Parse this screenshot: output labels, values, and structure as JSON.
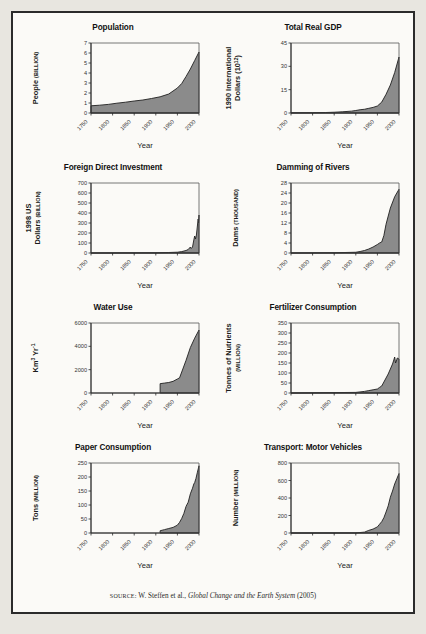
{
  "figure": {
    "source_prefix": "SOURCE:",
    "source_text": "W. Steffen et al.,",
    "source_title": "Global Change and the Earth System",
    "source_year": "(2005)",
    "background_color": "#fbfaf7",
    "border_color": "#2b2b2b",
    "area_fill_color": "#8b8b8b",
    "area_stroke_color": "#1f1f1f"
  },
  "chart_data": [
    {
      "type": "area",
      "title": "Population",
      "xlabel": "Year",
      "ylabel": "People",
      "ylabel_units": "(BILLION)",
      "xlim": [
        1750,
        2000
      ],
      "ylim": [
        0,
        7
      ],
      "xticks": [
        1750,
        1800,
        1850,
        1900,
        1950,
        2000
      ],
      "yticks": [
        0,
        1,
        2,
        3,
        4,
        5,
        6,
        7
      ],
      "grid": false,
      "legend": "none",
      "x": [
        1750,
        1770,
        1790,
        1810,
        1830,
        1850,
        1870,
        1890,
        1910,
        1930,
        1950,
        1960,
        1970,
        1980,
        1990,
        2000
      ],
      "values": [
        0.72,
        0.78,
        0.86,
        0.98,
        1.08,
        1.2,
        1.3,
        1.45,
        1.62,
        1.9,
        2.5,
        2.95,
        3.65,
        4.4,
        5.25,
        6.1
      ]
    },
    {
      "type": "area",
      "title": "Total Real GDP",
      "xlabel": "Year",
      "ylabel": "1990 International Dollars (10¹²)",
      "ylabel_line1": "1990 International",
      "ylabel_line2": "Dollars (10",
      "ylabel_exp": "12",
      "xlim": [
        1750,
        2000
      ],
      "ylim": [
        0,
        45
      ],
      "xticks": [
        1750,
        1800,
        1850,
        1900,
        1950,
        2000
      ],
      "yticks": [
        0,
        15,
        30,
        45
      ],
      "grid": false,
      "legend": "none",
      "x": [
        1750,
        1800,
        1830,
        1850,
        1870,
        1890,
        1900,
        1910,
        1920,
        1930,
        1940,
        1950,
        1960,
        1970,
        1980,
        1990,
        2000
      ],
      "values": [
        0.1,
        0.2,
        0.3,
        0.5,
        0.8,
        1.2,
        1.6,
        2.1,
        2.4,
        3.0,
        3.6,
        4.5,
        7.0,
        12.0,
        18.0,
        26.0,
        36.0
      ]
    },
    {
      "type": "area",
      "title": "Foreign Direct Investment",
      "xlabel": "Year",
      "ylabel": "1998 US Dollars",
      "ylabel_line1": "1998 US",
      "ylabel_line2": "Dollars",
      "ylabel_units": "(BILLION)",
      "xlim": [
        1750,
        2000
      ],
      "ylim": [
        0,
        700
      ],
      "xticks": [
        1750,
        1800,
        1850,
        1900,
        1950,
        2000
      ],
      "yticks": [
        0,
        100,
        200,
        300,
        400,
        500,
        600,
        700
      ],
      "grid": false,
      "legend": "none",
      "x": [
        1750,
        1900,
        1930,
        1950,
        1960,
        1970,
        1975,
        1980,
        1982,
        1985,
        1988,
        1990,
        1992,
        1994,
        1996,
        1998,
        1999,
        2000,
        2002
      ],
      "values": [
        0,
        2,
        5,
        8,
        14,
        25,
        35,
        60,
        45,
        60,
        130,
        170,
        140,
        180,
        260,
        340,
        300,
        380,
        250
      ]
    },
    {
      "type": "area",
      "title": "Damming of Rivers",
      "xlabel": "Year",
      "ylabel": "Dams",
      "ylabel_units": "(THOUSAND)",
      "xlim": [
        1750,
        2000
      ],
      "ylim": [
        0,
        28
      ],
      "xticks": [
        1750,
        1800,
        1850,
        1900,
        1950,
        2000
      ],
      "yticks": [
        0,
        4,
        8,
        12,
        16,
        20,
        24,
        28
      ],
      "grid": false,
      "legend": "none",
      "x": [
        1750,
        1850,
        1900,
        1910,
        1920,
        1930,
        1940,
        1950,
        1955,
        1960,
        1965,
        1970,
        1980,
        1990,
        2000
      ],
      "values": [
        0,
        0.1,
        0.3,
        0.6,
        1.0,
        1.6,
        2.4,
        3.4,
        4.0,
        4.4,
        7.0,
        11.5,
        18.0,
        22.5,
        25.5
      ]
    },
    {
      "type": "area",
      "title": "Water Use",
      "xlabel": "Year",
      "ylabel": "Km³ Yr⁻¹",
      "ylabel_base": "Km",
      "ylabel_exp1": "3",
      "ylabel_base2": "Yr",
      "ylabel_exp2": "-1",
      "xlim": [
        1750,
        2000
      ],
      "ylim": [
        0,
        6000
      ],
      "xticks": [
        1750,
        1800,
        1850,
        1900,
        1950,
        2000
      ],
      "yticks": [
        0,
        2000,
        4000,
        6000
      ],
      "grid": false,
      "legend": "none",
      "x": [
        1910,
        1920,
        1930,
        1940,
        1950,
        1955,
        1960,
        1970,
        1980,
        1990,
        2000
      ],
      "values": [
        800,
        850,
        900,
        1000,
        1200,
        1300,
        1800,
        2800,
        3900,
        4700,
        5400
      ]
    },
    {
      "type": "area",
      "title": "Fertilizer Consumption",
      "xlabel": "Year",
      "ylabel": "Tonnes of Nutrients",
      "ylabel_units": "(MILLION)",
      "xlim": [
        1750,
        2000
      ],
      "ylim": [
        0,
        350
      ],
      "xticks": [
        1750,
        1800,
        1850,
        1900,
        1950,
        2000
      ],
      "yticks": [
        0,
        50,
        100,
        150,
        200,
        250,
        300,
        350
      ],
      "grid": false,
      "legend": "none",
      "x": [
        1750,
        1900,
        1920,
        1930,
        1940,
        1950,
        1955,
        1960,
        1965,
        1970,
        1975,
        1980,
        1985,
        1988,
        1990,
        1992,
        1994,
        1996,
        2000
      ],
      "values": [
        0,
        3,
        8,
        12,
        16,
        20,
        28,
        35,
        55,
        75,
        95,
        120,
        145,
        165,
        180,
        150,
        160,
        175,
        170
      ]
    },
    {
      "type": "area",
      "title": "Paper Consumption",
      "xlabel": "Year",
      "ylabel": "Tons",
      "ylabel_units": "(MILLION)",
      "xlim": [
        1750,
        2000
      ],
      "ylim": [
        0,
        250
      ],
      "xticks": [
        1750,
        1800,
        1850,
        1900,
        1950,
        2000
      ],
      "yticks": [
        0,
        50,
        100,
        150,
        200,
        250
      ],
      "grid": false,
      "legend": "none",
      "x": [
        1910,
        1920,
        1930,
        1940,
        1950,
        1955,
        1960,
        1965,
        1970,
        1975,
        1980,
        1985,
        1988,
        1990,
        1993,
        1996,
        2000
      ],
      "values": [
        8,
        12,
        16,
        20,
        28,
        38,
        52,
        70,
        95,
        110,
        140,
        160,
        175,
        180,
        195,
        215,
        240
      ]
    },
    {
      "type": "area",
      "title": "Transport: Motor Vehicles",
      "xlabel": "Year",
      "ylabel": "Number",
      "ylabel_units": "(MILLION)",
      "xlim": [
        1750,
        2000
      ],
      "ylim": [
        0,
        800
      ],
      "xticks": [
        1750,
        1800,
        1850,
        1900,
        1950,
        2000
      ],
      "yticks": [
        0,
        200,
        400,
        600,
        800
      ],
      "grid": false,
      "legend": "none",
      "x": [
        1750,
        1900,
        1920,
        1930,
        1940,
        1950,
        1955,
        1960,
        1965,
        1970,
        1975,
        1980,
        1985,
        1990,
        1995,
        2000
      ],
      "values": [
        0,
        1,
        10,
        30,
        45,
        70,
        100,
        130,
        175,
        240,
        310,
        410,
        480,
        560,
        620,
        680
      ]
    }
  ]
}
